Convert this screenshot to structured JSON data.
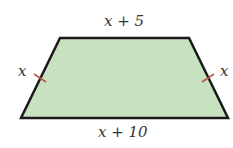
{
  "figure": {
    "shape": "trapezoid",
    "fill_color": "#c8e2c0",
    "stroke_color": "#1a1a1a",
    "tick_color": "#c0504d",
    "labels": {
      "top": "x + 5",
      "bottom": "x + 10",
      "left": "x",
      "right": "x"
    },
    "congruent_legs": true
  }
}
